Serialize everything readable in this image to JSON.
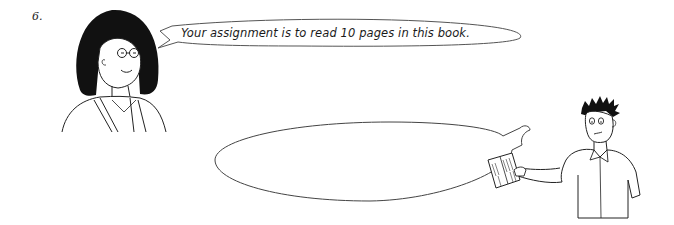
{
  "exercise": {
    "number": "6.",
    "teacher_speech": "Your assignment is to read 10 pages in this book.",
    "student_speech": ""
  },
  "characters": [
    {
      "role": "teacher",
      "description": "woman with long black hair and glasses"
    },
    {
      "role": "student",
      "description": "boy with spiky hair holding an open book"
    }
  ]
}
